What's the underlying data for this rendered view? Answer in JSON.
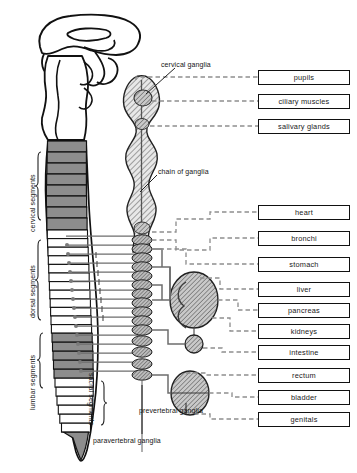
{
  "diagram": {
    "type": "anatomical-schematic",
    "colors": {
      "outline": "#111111",
      "segment_fill_shaded": "#8d8d8d",
      "segment_fill_plain": "#ffffff",
      "ganglion_hatch": "#6f6f6f",
      "solid_nerve": "#6d6d6d",
      "dashed_nerve": "#8a8a8a",
      "box_border": "#111111",
      "background": "#ffffff"
    }
  },
  "organ_boxes": [
    {
      "label": "pupils",
      "top": 70,
      "connector": "dashed"
    },
    {
      "label": "ciliary muscles",
      "top": 94,
      "connector": "dashed"
    },
    {
      "label": "salivary glands",
      "top": 119,
      "connector": "dashed"
    },
    {
      "label": "heart",
      "top": 205,
      "connector": "dashed"
    },
    {
      "label": "bronchi",
      "top": 231,
      "connector": "dashed"
    },
    {
      "label": "stomach",
      "top": 257,
      "connector": "dashed"
    },
    {
      "label": "liver",
      "top": 282,
      "connector": "dashed"
    },
    {
      "label": "pancreas",
      "top": 303,
      "connector": "dashed"
    },
    {
      "label": "kidneys",
      "top": 324,
      "connector": "dashed"
    },
    {
      "label": "intestine",
      "top": 345,
      "connector": "dashed"
    },
    {
      "label": "rectum",
      "top": 368,
      "connector": "dashed"
    },
    {
      "label": "bladder",
      "top": 390,
      "connector": "dashed"
    },
    {
      "label": "genitals",
      "top": 412,
      "connector": "dashed"
    }
  ],
  "annotations": [
    {
      "name": "cervical-ganglia",
      "text": "cervical ganglia",
      "left": 161,
      "top": 61
    },
    {
      "name": "chain-of-ganglia",
      "text": "chain of ganglia",
      "left": 158,
      "top": 168
    },
    {
      "name": "prevertebral-ganglia",
      "text": "prevertebral ganglia",
      "left": 139,
      "top": 407
    },
    {
      "name": "paravertebral-ganglia",
      "text": "paravertebral ganglia",
      "left": 93,
      "top": 437
    }
  ],
  "segment_labels": [
    {
      "name": "cervical-segments",
      "text": "cervical segments",
      "left": 29,
      "top": 232,
      "rotate": -90
    },
    {
      "name": "dorsal-segments",
      "text": "dorsal segments",
      "left": 29,
      "top": 318,
      "rotate": -90
    },
    {
      "name": "lumbar-segments",
      "text": "lumbar segments",
      "left": 29,
      "top": 410,
      "rotate": -90
    },
    {
      "name": "sacral-segments",
      "text": "sacral segments",
      "left": 93,
      "top": 373,
      "rotate": 90
    }
  ],
  "structures": {
    "brain": "brain-outline",
    "brainstem": "brainstem-outline",
    "spinal_cord": "spinal-cord-column",
    "sympathetic_chain_upper": "cervical-ganglia-chain",
    "sympathetic_chain_lower": "paravertebral-ganglia-beads",
    "prevertebral_large": "coeliac-ganglion",
    "prevertebral_small": "mesenteric-ganglion",
    "prevertebral_pelvic": "pelvic-ganglion"
  },
  "counts": {
    "cervical_shaded_segments": 8,
    "dorsal_segments": 12,
    "lumbar_shaded_segments": 5,
    "sacral_segments": 6,
    "paravertebral_ganglia_beads": 18
  }
}
